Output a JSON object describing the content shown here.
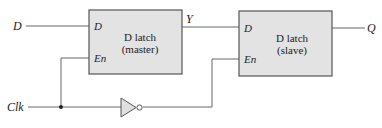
{
  "diagram": {
    "type": "master-slave D flip-flop",
    "inputs": {
      "d": "D",
      "clk": "Clk"
    },
    "output": {
      "q": "Q"
    },
    "intermediate": {
      "y": "Y"
    },
    "master": {
      "title_line1": "D latch",
      "title_line2": "(master)",
      "pin_d": "D",
      "pin_en": "En"
    },
    "slave": {
      "title_line1": "D latch",
      "title_line2": "(slave)",
      "pin_d": "D",
      "pin_en": "En"
    },
    "colors": {
      "box_fill": "#e3e3e3",
      "box_stroke": "#555555",
      "wire": "#666666",
      "text": "#222222"
    }
  }
}
